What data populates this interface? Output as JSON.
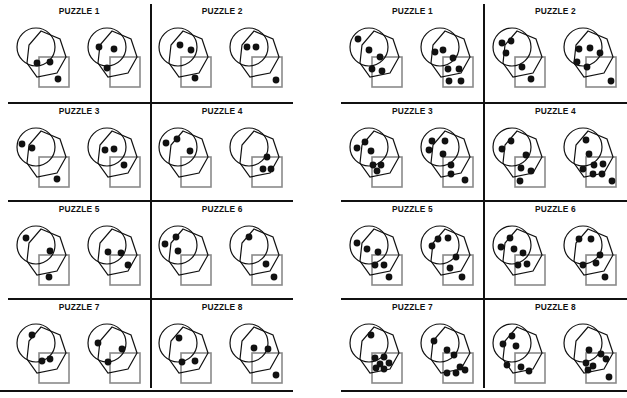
{
  "document": {
    "title": "Puzzle Worksheet",
    "grids": [
      {
        "name": "left-grid",
        "cells": [
          {
            "title": "PUZZLE 1",
            "panels": [
              {
                "dots": [
                  [
                    28,
                    46
                  ],
                  [
                    41,
                    45
                  ],
                  [
                    49,
                    62
                  ]
                ]
              },
              {
                "dots": [
                  [
                    19,
                    30
                  ],
                  [
                    34,
                    32
                  ],
                  [
                    27,
                    51
                  ]
                ]
              }
            ]
          },
          {
            "title": "PUZZLE 2",
            "panels": [
              {
                "dots": [
                  [
                    29,
                    28
                  ],
                  [
                    40,
                    33
                  ],
                  [
                    44,
                    61
                  ]
                ]
              },
              {
                "dots": [
                  [
                    25,
                    30
                  ],
                  [
                    34,
                    30
                  ],
                  [
                    54,
                    63
                  ]
                ]
              }
            ]
          },
          {
            "title": "PUZZLE 3",
            "panels": [
              {
                "dots": [
                  [
                    13,
                    27
                  ],
                  [
                    23,
                    31
                  ],
                  [
                    48,
                    62
                  ]
                ]
              },
              {
                "dots": [
                  [
                    25,
                    33
                  ],
                  [
                    34,
                    32
                  ],
                  [
                    44,
                    48
                  ]
                ]
              }
            ]
          },
          {
            "title": "PUZZLE 4",
            "panels": [
              {
                "dots": [
                  [
                    15,
                    26
                  ],
                  [
                    26,
                    22
                  ],
                  [
                    39,
                    34
                  ]
                ]
              },
              {
                "dots": [
                  [
                    45,
                    40
                  ],
                  [
                    41,
                    52
                  ],
                  [
                    49,
                    52
                  ]
                ]
              }
            ]
          },
          {
            "title": "PUZZLE 5",
            "panels": [
              {
                "dots": [
                  [
                    17,
                    23
                  ],
                  [
                    41,
                    36
                  ],
                  [
                    40,
                    62
                  ]
                ]
              },
              {
                "dots": [
                  [
                    28,
                    37
                  ],
                  [
                    41,
                    38
                  ],
                  [
                    48,
                    50
                  ]
                ]
              }
            ]
          },
          {
            "title": "PUZZLE 6",
            "panels": [
              {
                "dots": [
                  [
                    14,
                    29
                  ],
                  [
                    25,
                    22
                  ],
                  [
                    27,
                    36
                  ]
                ]
              },
              {
                "dots": [
                  [
                    27,
                    22
                  ],
                  [
                    44,
                    49
                  ],
                  [
                    52,
                    62
                  ]
                ]
              }
            ]
          },
          {
            "title": "PUZZLE 7",
            "panels": [
              {
                "dots": [
                  [
                    23,
                    22
                  ],
                  [
                    33,
                    48
                  ],
                  [
                    41,
                    46
                  ]
                ]
              },
              {
                "dots": [
                  [
                    18,
                    30
                  ],
                  [
                    42,
                    36
                  ],
                  [
                    28,
                    49
                  ]
                ]
              }
            ]
          },
          {
            "title": "PUZZLE 8",
            "panels": [
              {
                "dots": [
                  [
                    28,
                    25
                  ],
                  [
                    31,
                    49
                  ],
                  [
                    44,
                    48
                  ]
                ]
              },
              {
                "dots": [
                  [
                    32,
                    35
                  ],
                  [
                    46,
                    36
                  ],
                  [
                    54,
                    62
                  ]
                ]
              }
            ]
          }
        ]
      },
      {
        "name": "right-grid",
        "cells": [
          {
            "title": "PUZZLE 1",
            "panels": [
              {
                "dots": [
                  [
                    16,
                    22
                  ],
                  [
                    27,
                    33
                  ],
                  [
                    38,
                    40
                  ],
                  [
                    30,
                    52
                  ],
                  [
                    40,
                    54
                  ]
                ]
              },
              {
                "dots": [
                  [
                    22,
                    35
                  ],
                  [
                    30,
                    33
                  ],
                  [
                    40,
                    41
                  ],
                  [
                    35,
                    52
                  ],
                  [
                    46,
                    52
                  ],
                  [
                    36,
                    64
                  ],
                  [
                    48,
                    64
                  ]
                ]
              }
            ]
          },
          {
            "title": "PUZZLE 2",
            "panels": [
              {
                "dots": [
                  [
                    17,
                    26
                  ],
                  [
                    26,
                    24
                  ],
                  [
                    21,
                    36
                  ],
                  [
                    37,
                    50
                  ],
                  [
                    46,
                    62
                  ]
                ]
              },
              {
                "dots": [
                  [
                    23,
                    32
                  ],
                  [
                    34,
                    31
                  ],
                  [
                    44,
                    36
                  ],
                  [
                    21,
                    45
                  ],
                  [
                    31,
                    50
                  ],
                  [
                    55,
                    64
                  ]
                ]
              }
            ]
          },
          {
            "title": "PUZZLE 3",
            "panels": [
              {
                "dots": [
                  [
                    23,
                    25
                  ],
                  [
                    15,
                    31
                  ],
                  [
                    29,
                    34
                  ],
                  [
                    31,
                    48
                  ],
                  [
                    39,
                    48
                  ],
                  [
                    35,
                    54
                  ]
                ]
              },
              {
                "dots": [
                  [
                    19,
                    24
                  ],
                  [
                    32,
                    24
                  ],
                  [
                    16,
                    33
                  ],
                  [
                    30,
                    37
                  ],
                  [
                    38,
                    48
                  ],
                  [
                    38,
                    57
                  ],
                  [
                    52,
                    63
                  ]
                ]
              }
            ]
          },
          {
            "title": "PUZZLE 4",
            "panels": [
              {
                "dots": [
                  [
                    26,
                    24
                  ],
                  [
                    17,
                    32
                  ],
                  [
                    41,
                    38
                  ],
                  [
                    36,
                    51
                  ],
                  [
                    46,
                    54
                  ],
                  [
                    35,
                    64
                  ]
                ]
              },
              {
                "dots": [
                  [
                    30,
                    23
                  ],
                  [
                    33,
                    37
                  ],
                  [
                    27,
                    52
                  ],
                  [
                    38,
                    48
                  ],
                  [
                    47,
                    47
                  ],
                  [
                    37,
                    57
                  ],
                  [
                    46,
                    57
                  ],
                  [
                    56,
                    64
                  ]
                ]
              }
            ]
          },
          {
            "title": "PUZZLE 5",
            "panels": [
              {
                "dots": [
                  [
                    15,
                    28
                  ],
                  [
                    25,
                    34
                  ],
                  [
                    36,
                    37
                  ],
                  [
                    33,
                    50
                  ],
                  [
                    42,
                    50
                  ],
                  [
                    47,
                    62
                  ]
                ]
              },
              {
                "dots": [
                  [
                    25,
                    24
                  ],
                  [
                    35,
                    23
                  ],
                  [
                    19,
                    31
                  ],
                  [
                    43,
                    42
                  ],
                  [
                    37,
                    53
                  ],
                  [
                    49,
                    62
                  ]
                ]
              }
            ]
          },
          {
            "title": "PUZZLE 6",
            "panels": [
              {
                "dots": [
                  [
                    25,
                    23
                  ],
                  [
                    16,
                    32
                  ],
                  [
                    29,
                    34
                  ],
                  [
                    38,
                    38
                  ],
                  [
                    33,
                    50
                  ],
                  [
                    42,
                    49
                  ]
                ]
              },
              {
                "dots": [
                  [
                    23,
                    24
                  ],
                  [
                    35,
                    24
                  ],
                  [
                    44,
                    40
                  ],
                  [
                    27,
                    50
                  ],
                  [
                    40,
                    48
                  ],
                  [
                    49,
                    62
                  ]
                ]
              }
            ]
          },
          {
            "title": "PUZZLE 7",
            "panels": [
              {
                "dots": [
                  [
                    29,
                    22
                  ],
                  [
                    33,
                    45
                  ],
                  [
                    42,
                    44
                  ],
                  [
                    38,
                    51
                  ],
                  [
                    47,
                    50
                  ],
                  [
                    34,
                    55
                  ],
                  [
                    42,
                    56
                  ]
                ]
              },
              {
                "dots": [
                  [
                    21,
                    28
                  ],
                  [
                    34,
                    37
                  ],
                  [
                    41,
                    42
                  ],
                  [
                    47,
                    54
                  ],
                  [
                    34,
                    60
                  ],
                  [
                    43,
                    60
                  ],
                  [
                    52,
                    57
                  ]
                ]
              }
            ]
          },
          {
            "title": "PUZZLE 8",
            "panels": [
              {
                "dots": [
                  [
                    27,
                    23
                  ],
                  [
                    18,
                    31
                  ],
                  [
                    31,
                    33
                  ],
                  [
                    22,
                    52
                  ],
                  [
                    36,
                    54
                  ],
                  [
                    44,
                    58
                  ]
                ]
              },
              {
                "dots": [
                  [
                    33,
                    37
                  ],
                  [
                    45,
                    41
                  ],
                  [
                    50,
                    46
                  ],
                  [
                    30,
                    50
                  ],
                  [
                    37,
                    53
                  ],
                  [
                    32,
                    57
                  ],
                  [
                    53,
                    64
                  ]
                ]
              }
            ]
          }
        ]
      }
    ]
  },
  "shapes": {
    "circle": {
      "cx": 27,
      "cy": 30,
      "r": 19,
      "stroke": "#111111",
      "width": 1.2
    },
    "heptagon": {
      "points": "32,14 51,22 57,40 48,56 28,60 18,46 20,28",
      "stroke": "#111111",
      "width": 1.2
    },
    "square": {
      "x": 30,
      "y": 40,
      "size": 30,
      "stroke": "#8a8a8a",
      "width": 1.6
    },
    "dot": {
      "r": 3.4,
      "fill": "#111111"
    }
  }
}
